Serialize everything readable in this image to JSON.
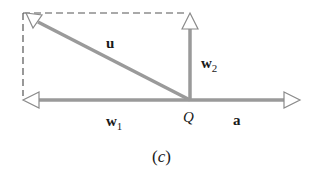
{
  "figure": {
    "caption": "(c)",
    "caption_letter": "c",
    "colors": {
      "vector": "#9a9a9a",
      "dashed": "#555555",
      "arrowhead_fill": "#ffffff",
      "text": "#1a1a1a"
    },
    "origin": {
      "label": "Q",
      "x": 190,
      "y": 100
    },
    "vectors": [
      {
        "id": "u",
        "label": "u",
        "subscript": "",
        "from": [
          190,
          100
        ],
        "to": [
          28,
          17
        ]
      },
      {
        "id": "w2",
        "label": "w",
        "subscript": "2",
        "from": [
          190,
          100
        ],
        "to": [
          190,
          15
        ]
      },
      {
        "id": "w1",
        "label": "w",
        "subscript": "1",
        "from": [
          190,
          100
        ],
        "to": [
          22,
          100
        ]
      },
      {
        "id": "a",
        "label": "a",
        "subscript": "",
        "from": [
          190,
          100
        ],
        "to": [
          300,
          100
        ]
      }
    ],
    "dashed_rectangle": {
      "left": 23,
      "top": 13,
      "right": 190,
      "bottom": 100
    }
  }
}
